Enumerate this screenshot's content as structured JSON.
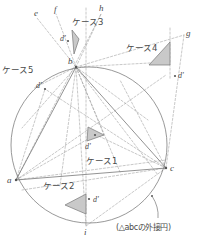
{
  "figure": {
    "title_caption": "(△abcの外接円)",
    "colors": {
      "stroke": "#777777",
      "dashed": "#9a9a9a",
      "fill": "#c9c9c9",
      "text": "#4a4a4a",
      "background": "#ffffff"
    },
    "circle": {
      "label": "circumcircle-of-abc",
      "cx": 89,
      "cy": 145,
      "r": 78
    },
    "vertices": [
      {
        "name": "a",
        "label": "a",
        "x": 16,
        "y": 180,
        "label_x": 7,
        "label_y": 176
      },
      {
        "name": "b",
        "label": "b",
        "x": 76,
        "y": 67,
        "label_x": 68,
        "label_y": 57
      },
      {
        "name": "c",
        "label": "c",
        "x": 166,
        "y": 168,
        "label_x": 170,
        "label_y": 164
      }
    ],
    "ray_points": [
      {
        "name": "e",
        "label": "e",
        "x": 37,
        "y": 18,
        "label_x": 34,
        "label_y": 9
      },
      {
        "name": "f",
        "label": "f",
        "x": 56,
        "y": 14,
        "label_x": 54,
        "label_y": 5
      },
      {
        "name": "h",
        "label": "h",
        "x": 101,
        "y": 14,
        "label_x": 99,
        "label_y": 4
      },
      {
        "name": "g",
        "label": "g",
        "x": 184,
        "y": 35,
        "label_x": 186,
        "label_y": 29
      },
      {
        "name": "i",
        "label": "i",
        "x": 86,
        "y": 226,
        "label_x": 84,
        "label_y": 228
      }
    ],
    "cases": [
      {
        "name": "case-1",
        "label": "ケース1",
        "label_x": 86,
        "label_y": 157,
        "dprime": "d'",
        "dprime_x": 85,
        "dprime_y": 143,
        "dot_x": 95,
        "dot_y": 135,
        "triangle": "88,127 104,135 87,141"
      },
      {
        "name": "case-2",
        "label": "ケース2",
        "label_x": 43,
        "label_y": 182,
        "dprime": "d'",
        "dprime_x": 93,
        "dprime_y": 196,
        "dot_x": 89,
        "dot_y": 199,
        "triangle": "65,205 86,194 86,214"
      },
      {
        "name": "case-3",
        "label": "ケース3",
        "label_x": 72,
        "label_y": 18,
        "dprime": "d'",
        "dprime_x": 60,
        "dprime_y": 35,
        "dot_x": 68,
        "dot_y": 41,
        "triangle": "72,30 79,39 74,54"
      },
      {
        "name": "case-4",
        "label": "ケース4",
        "label_x": 126,
        "label_y": 44,
        "dprime": "d'",
        "dprime_x": 178,
        "dprime_y": 72,
        "dot_x": 175,
        "dot_y": 76,
        "triangle": "170,42 170,65 149,65"
      },
      {
        "name": "case-5",
        "label": "ケース5",
        "label_x": 2,
        "label_y": 66,
        "dprime": "d'",
        "dprime_x": 36,
        "dprime_y": 82,
        "dot_x": 45,
        "dot_y": 89,
        "triangle": ""
      }
    ],
    "solid_edges": [
      {
        "name": "edge-ab",
        "x1": 76,
        "y1": 67,
        "x2": 16,
        "y2": 180
      },
      {
        "name": "edge-bc",
        "x1": 76,
        "y1": 67,
        "x2": 166,
        "y2": 168
      },
      {
        "name": "edge-ac",
        "x1": 16,
        "y1": 180,
        "x2": 166,
        "y2": 168
      }
    ],
    "dashed_segments": [
      {
        "name": "ray-b-e",
        "x1": 76,
        "y1": 67,
        "x2": 37,
        "y2": 18
      },
      {
        "name": "ray-b-f",
        "x1": 76,
        "y1": 67,
        "x2": 56,
        "y2": 14
      },
      {
        "name": "ray-b-h",
        "x1": 76,
        "y1": 67,
        "x2": 101,
        "y2": 14
      },
      {
        "name": "ray-b-i",
        "x1": 76,
        "y1": 67,
        "x2": 86,
        "y2": 226
      },
      {
        "name": "ray-b-d5",
        "x1": 76,
        "y1": 67,
        "x2": 34,
        "y2": 88
      },
      {
        "name": "ray-b-dl",
        "x1": 76,
        "y1": 67,
        "x2": 22,
        "y2": 128
      },
      {
        "name": "ray-b-c2",
        "x1": 76,
        "y1": 67,
        "x2": 60,
        "y2": 186
      },
      {
        "name": "ray-b-c1",
        "x1": 76,
        "y1": 67,
        "x2": 104,
        "y2": 135
      },
      {
        "name": "ray-b-ac-mid",
        "x1": 76,
        "y1": 67,
        "x2": 120,
        "y2": 172
      },
      {
        "name": "ray-b-c-dash",
        "x1": 76,
        "y1": 67,
        "x2": 158,
        "y2": 175
      },
      {
        "name": "ray-b-g",
        "x1": 76,
        "y1": 67,
        "x2": 184,
        "y2": 35
      },
      {
        "name": "ray-b-right",
        "x1": 76,
        "y1": 67,
        "x2": 168,
        "y2": 62
      },
      {
        "name": "chord-a-h",
        "x1": 16,
        "y1": 180,
        "x2": 101,
        "y2": 14
      },
      {
        "name": "chord-a-g",
        "x1": 16,
        "y1": 180,
        "x2": 166,
        "y2": 75
      },
      {
        "name": "chord-a-c1",
        "x1": 16,
        "y1": 180,
        "x2": 95,
        "y2": 135
      },
      {
        "name": "chord-a-c-up",
        "x1": 16,
        "y1": 180,
        "x2": 166,
        "y2": 160
      },
      {
        "name": "chord-a-d5",
        "x1": 16,
        "y1": 180,
        "x2": 45,
        "y2": 89
      },
      {
        "name": "chord-c-d5",
        "x1": 166,
        "y1": 168,
        "x2": 45,
        "y2": 89
      },
      {
        "name": "chord-c-c1",
        "x1": 166,
        "y1": 168,
        "x2": 88,
        "y2": 131
      },
      {
        "name": "chord-c-a-low",
        "x1": 166,
        "y1": 168,
        "x2": 22,
        "y2": 190
      },
      {
        "name": "chord-c-i",
        "x1": 166,
        "y1": 168,
        "x2": 86,
        "y2": 226
      },
      {
        "name": "chord-c-g",
        "x1": 166,
        "y1": 168,
        "x2": 184,
        "y2": 35
      },
      {
        "name": "chord-c-b-upper",
        "x1": 166,
        "y1": 168,
        "x2": 120,
        "y2": 80
      },
      {
        "name": "vert-guide-top",
        "x1": 86,
        "y1": 8,
        "x2": 86,
        "y2": 226
      },
      {
        "name": "vert-guide-g",
        "x1": 170,
        "y1": 28,
        "x2": 170,
        "y2": 80
      },
      {
        "name": "chord-b-right-low",
        "x1": 76,
        "y1": 67,
        "x2": 148,
        "y2": 120
      }
    ],
    "small_dots": [
      {
        "name": "dot-arc-marker",
        "x": 152,
        "y": 196
      }
    ],
    "caption": {
      "text": "(△abcの外接円)",
      "x": 116,
      "y": 224,
      "leader": {
        "x1": 152,
        "y1": 196,
        "x2": 158,
        "y2": 218
      }
    }
  }
}
